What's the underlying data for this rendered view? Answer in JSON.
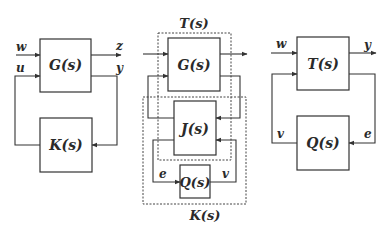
{
  "diagram": {
    "left": {
      "plant_block": "G(s)",
      "controller_block": "K(s)",
      "signals": {
        "w": "w",
        "u": "u",
        "z": "z",
        "y": "y"
      }
    },
    "middle": {
      "plant_block": "G(s)",
      "j_block": "J(s)",
      "q_block": "Q(s)",
      "t_group_label": "T(s)",
      "k_group_label": "K(s)",
      "signals": {
        "e": "e",
        "v": "v"
      }
    },
    "right": {
      "t_block": "T(s)",
      "q_block": "Q(s)",
      "signals": {
        "w": "w",
        "y": "y",
        "v": "v",
        "e": "e"
      }
    },
    "colors": {
      "stroke": "#333333",
      "text": "#2a2a2a",
      "background": "#ffffff"
    }
  }
}
